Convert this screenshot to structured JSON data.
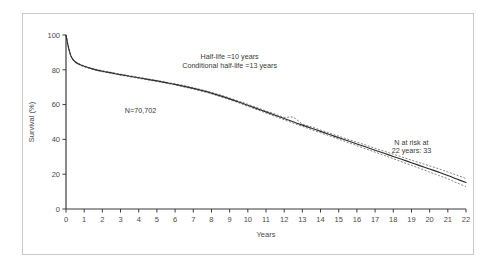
{
  "figure": {
    "background_color": "#ffffff",
    "border_color": "#c9c9c9"
  },
  "axes": {
    "x_title": "Years",
    "y_title": "Survival (%)",
    "x_ticks": [
      "0",
      "1",
      "2",
      "3",
      "4",
      "5",
      "6",
      "7",
      "8",
      "9",
      "10",
      "11",
      "12",
      "13",
      "14",
      "15",
      "16",
      "17",
      "18",
      "19",
      "20",
      "21",
      "22"
    ],
    "y_ticks": [
      "0",
      "20",
      "40",
      "60",
      "80",
      "100"
    ]
  },
  "annotations": {
    "half_life_line1": "Half-life =10 years",
    "half_life_line2": "Conditional half-life =13 years",
    "sample_size": "N=70,702",
    "at_risk_line1": "N at risk at",
    "at_risk_line2": "22 years: 33"
  },
  "chart_data": {
    "type": "line",
    "title": "",
    "xlabel": "Years",
    "ylabel": "Survival (%)",
    "xlim": [
      0,
      22
    ],
    "ylim": [
      0,
      100
    ],
    "grid": false,
    "legend": "none",
    "x_tick_values": [
      0,
      1,
      2,
      3,
      4,
      5,
      6,
      7,
      8,
      9,
      10,
      11,
      12,
      13,
      14,
      15,
      16,
      17,
      18,
      19,
      20,
      21,
      22
    ],
    "y_tick_values": [
      0,
      20,
      40,
      60,
      80,
      100
    ],
    "x": [
      0,
      0.08,
      0.17,
      0.25,
      0.35,
      0.5,
      0.7,
      1,
      1.5,
      2,
      2.5,
      3,
      3.5,
      4,
      4.5,
      5,
      5.5,
      6,
      6.5,
      7,
      7.5,
      8,
      8.5,
      9,
      9.5,
      10,
      10.5,
      11,
      11.5,
      12,
      12.5,
      13,
      13.5,
      14,
      14.5,
      15,
      15.5,
      16,
      16.5,
      17,
      17.5,
      18,
      18.5,
      19,
      19.5,
      20,
      20.5,
      21,
      21.5,
      22
    ],
    "series": [
      {
        "name": "Survival",
        "style": "solid",
        "color": "#2e2e2e",
        "values": [
          100,
          95.5,
          91.5,
          88.6,
          86.4,
          84.6,
          83.3,
          82.0,
          80.4,
          79.2,
          78.2,
          77.2,
          76.3,
          75.4,
          74.5,
          73.6,
          72.6,
          71.6,
          70.5,
          69.3,
          68.0,
          66.6,
          65.0,
          63.3,
          61.5,
          59.6,
          57.7,
          55.8,
          53.9,
          52.0,
          50.1,
          48.2,
          46.4,
          44.6,
          42.8,
          41.0,
          39.2,
          37.4,
          35.6,
          33.8,
          32.0,
          30.2,
          28.4,
          26.6,
          24.8,
          23.0,
          21.2,
          19.3,
          17.2,
          15.2
        ]
      },
      {
        "name": "Upper 95% CI",
        "style": "dashed",
        "color": "#6e6e6e",
        "values": [
          100,
          95.7,
          91.8,
          88.9,
          86.7,
          84.9,
          83.6,
          82.3,
          80.7,
          79.5,
          78.5,
          77.5,
          76.6,
          75.7,
          74.8,
          73.9,
          72.9,
          71.9,
          70.9,
          69.7,
          68.4,
          67.0,
          65.5,
          63.8,
          62.0,
          60.2,
          58.3,
          56.4,
          54.6,
          52.7,
          52.7,
          48.9,
          47.2,
          45.4,
          43.6,
          41.9,
          40.1,
          38.4,
          36.7,
          34.9,
          33.2,
          31.5,
          29.8,
          28.1,
          26.4,
          24.8,
          23.1,
          21.3,
          19.4,
          17.5
        ]
      },
      {
        "name": "Lower 95% CI",
        "style": "dashed",
        "color": "#6e6e6e",
        "values": [
          100,
          95.3,
          91.2,
          88.3,
          86.1,
          84.3,
          83.0,
          81.7,
          80.1,
          78.9,
          77.9,
          76.9,
          76.0,
          75.1,
          74.2,
          73.3,
          72.3,
          71.3,
          70.1,
          68.9,
          67.6,
          66.2,
          64.5,
          62.8,
          61.0,
          59.0,
          57.1,
          55.2,
          53.2,
          51.3,
          49.3,
          47.5,
          45.6,
          43.8,
          42.0,
          40.1,
          38.3,
          36.4,
          34.5,
          32.7,
          30.8,
          28.9,
          27.0,
          25.1,
          23.2,
          21.2,
          19.3,
          17.3,
          15.0,
          12.9
        ]
      }
    ],
    "annotations": [
      {
        "text": "Half-life =10 years",
        "x": 9.0,
        "y": 86
      },
      {
        "text": "Conditional half-life =13 years",
        "x": 9.0,
        "y": 81
      },
      {
        "text": "N=70,702",
        "x": 4.1,
        "y": 55
      },
      {
        "text": "N at risk at",
        "x": 19.0,
        "y": 37
      },
      {
        "text": "22 years: 33",
        "x": 19.0,
        "y": 32
      }
    ]
  }
}
